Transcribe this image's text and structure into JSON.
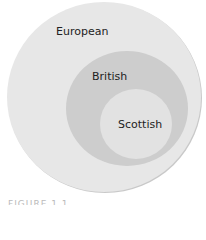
{
  "diagram": {
    "type": "nested-set-diagram",
    "sets": [
      {
        "label": "European",
        "color": "#e7e7e7"
      },
      {
        "label": "British",
        "color": "#cdcdcd"
      },
      {
        "label": "Scottish",
        "color": "#e2e2e2"
      }
    ],
    "caption": "FIGURE 1.1"
  }
}
